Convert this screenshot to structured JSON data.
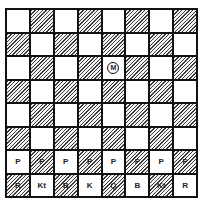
{
  "board": {
    "size": 8,
    "top_left_color": "light",
    "colors": {
      "light": "#ffffff",
      "dark_hatch": "#3a3a3a",
      "border": "#111111"
    },
    "marker": {
      "label": "M",
      "row": 2,
      "col": 4
    },
    "rows": [
      [
        "",
        "",
        "",
        "",
        "",
        "",
        "",
        ""
      ],
      [
        "",
        "",
        "",
        "",
        "",
        "",
        "",
        ""
      ],
      [
        "",
        "",
        "",
        "",
        "",
        "",
        "",
        ""
      ],
      [
        "",
        "",
        "",
        "",
        "",
        "",
        "",
        ""
      ],
      [
        "",
        "",
        "",
        "",
        "",
        "",
        "",
        ""
      ],
      [
        "",
        "",
        "",
        "",
        "",
        "",
        "",
        ""
      ],
      [
        "P",
        "P",
        "P",
        "P",
        "P",
        "P",
        "P",
        "P"
      ],
      [
        "R",
        "Kt",
        "B",
        "K",
        "Q",
        "B",
        "Kt",
        "R"
      ]
    ]
  }
}
